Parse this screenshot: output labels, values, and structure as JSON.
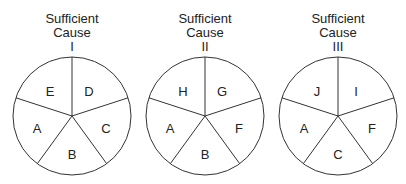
{
  "diagram": {
    "type": "sufficient-component-cause-pies",
    "pies": [
      {
        "title_line1": "Sufficient",
        "title_line2": "Cause",
        "numeral": "I",
        "slices": {
          "top_left": "E",
          "top_right": "D",
          "left": "A",
          "bottom": "B",
          "right": "C"
        }
      },
      {
        "title_line1": "Sufficient",
        "title_line2": "Cause",
        "numeral": "II",
        "slices": {
          "top_left": "H",
          "top_right": "G",
          "left": "A",
          "bottom": "B",
          "right": "F"
        }
      },
      {
        "title_line1": "Sufficient",
        "title_line2": "Cause",
        "numeral": "III",
        "slices": {
          "top_left": "J",
          "top_right": "I",
          "left": "A",
          "bottom": "C",
          "right": "F"
        }
      }
    ]
  }
}
